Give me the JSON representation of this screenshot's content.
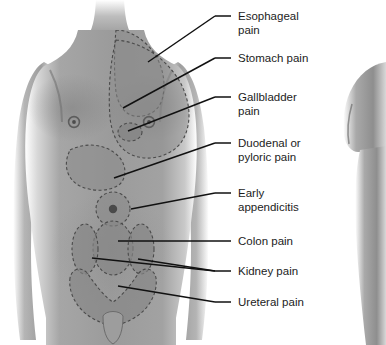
{
  "illustration": {
    "title": "Referred visceral pain sites on anterior torso",
    "subject": "male-torso-anterior",
    "background_color": "#ffffff",
    "skin_color": "#9a9a9a",
    "skin_shadow_color": "#6f6f6f",
    "skin_highlight_color": "#c8c8c8",
    "pain_region_color": "#8a8a8a",
    "pain_region_border_color": "#4a4a4a",
    "leader_line_color": "#111111",
    "text_color": "#1c1c1c",
    "second_figure": {
      "name": "partial-figure-right",
      "description": "cropped arm and torso of a second figure at right edge"
    }
  },
  "labels": [
    {
      "id": "esophageal-pain",
      "lines": [
        "Esophageal",
        "pain"
      ],
      "text_x": 238,
      "text_y": 20,
      "dash": {
        "x1": 215,
        "y1": 16,
        "x2": 231,
        "y2": 16
      },
      "leaders": [
        {
          "x1": 215,
          "y1": 16,
          "x2": 148,
          "y2": 62
        }
      ]
    },
    {
      "id": "stomach-pain",
      "lines": [
        "Stomach pain"
      ],
      "text_x": 238,
      "text_y": 62,
      "dash": {
        "x1": 215,
        "y1": 58,
        "x2": 231,
        "y2": 58
      },
      "leaders": [
        {
          "x1": 215,
          "y1": 58,
          "x2": 123,
          "y2": 108
        }
      ]
    },
    {
      "id": "gallbladder-pain",
      "lines": [
        "Gallbladder",
        "pain"
      ],
      "text_x": 238,
      "text_y": 101,
      "dash": {
        "x1": 215,
        "y1": 97,
        "x2": 231,
        "y2": 97
      },
      "leaders": [
        {
          "x1": 215,
          "y1": 97,
          "x2": 128,
          "y2": 131
        }
      ]
    },
    {
      "id": "duodenal-or-pyloric-pain",
      "lines": [
        "Duodenal or",
        "pyloric pain"
      ],
      "text_x": 238,
      "text_y": 147,
      "dash": {
        "x1": 215,
        "y1": 143,
        "x2": 231,
        "y2": 143
      },
      "leaders": [
        {
          "x1": 215,
          "y1": 143,
          "x2": 114,
          "y2": 178
        }
      ]
    },
    {
      "id": "early-appendicitis",
      "lines": [
        "Early",
        "appendicitis"
      ],
      "text_x": 238,
      "text_y": 197,
      "dash": {
        "x1": 215,
        "y1": 193,
        "x2": 231,
        "y2": 193
      },
      "leaders": [
        {
          "x1": 215,
          "y1": 193,
          "x2": 131,
          "y2": 209
        }
      ]
    },
    {
      "id": "colon-pain",
      "lines": [
        "Colon pain"
      ],
      "text_x": 238,
      "text_y": 245,
      "dash": {
        "x1": 215,
        "y1": 241,
        "x2": 231,
        "y2": 241
      },
      "leaders": [
        {
          "x1": 215,
          "y1": 241,
          "x2": 118,
          "y2": 241
        }
      ]
    },
    {
      "id": "kidney-pain",
      "lines": [
        "Kidney pain"
      ],
      "text_x": 238,
      "text_y": 275,
      "dash": {
        "x1": 215,
        "y1": 271,
        "x2": 231,
        "y2": 271
      },
      "leaders": [
        {
          "x1": 215,
          "y1": 271,
          "x2": 92,
          "y2": 258
        },
        {
          "x1": 215,
          "y1": 271,
          "x2": 138,
          "y2": 259
        }
      ]
    },
    {
      "id": "ureteral-pain",
      "lines": [
        "Ureteral pain"
      ],
      "text_x": 238,
      "text_y": 306,
      "dash": {
        "x1": 215,
        "y1": 302,
        "x2": 231,
        "y2": 302
      },
      "leaders": [
        {
          "x1": 215,
          "y1": 302,
          "x2": 118,
          "y2": 286
        }
      ]
    }
  ],
  "pain_regions": [
    {
      "id": "esophageal-region",
      "name": "esophageal-pain-region"
    },
    {
      "id": "stomach-region",
      "name": "stomach-pain-region"
    },
    {
      "id": "gallbladder-region",
      "name": "gallbladder-pain-region"
    },
    {
      "id": "duodenal-region",
      "name": "duodenal-pyloric-pain-region"
    },
    {
      "id": "appendicitis-region",
      "name": "early-appendicitis-pain-region"
    },
    {
      "id": "colon-region",
      "name": "colon-pain-region"
    },
    {
      "id": "kidney-left-region",
      "name": "kidney-pain-region-left"
    },
    {
      "id": "kidney-right-region",
      "name": "kidney-pain-region-right"
    },
    {
      "id": "ureteral-region",
      "name": "ureteral-pain-region"
    }
  ]
}
